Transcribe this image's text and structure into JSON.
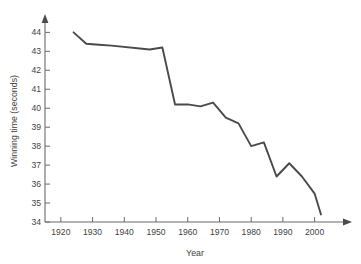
{
  "chart_data": {
    "type": "line",
    "title": "",
    "xlabel": "Year",
    "ylabel": "Winning time (seconds)",
    "xlim": [
      1915,
      2008
    ],
    "ylim": [
      34,
      44.6
    ],
    "grid": false,
    "legend": "none",
    "xticks": [
      1920,
      1930,
      1940,
      1950,
      1960,
      1970,
      1980,
      1990,
      2000
    ],
    "xtick_labels": [
      "1920",
      "1930",
      "1940",
      "1950",
      "1960",
      "1970",
      "1980",
      "1990",
      "2000"
    ],
    "yticks": [
      34,
      35,
      36,
      37,
      38,
      39,
      40,
      41,
      42,
      43,
      44
    ],
    "ytick_labels": [
      "34",
      "35",
      "36",
      "37",
      "38",
      "39",
      "40",
      "41",
      "42",
      "43",
      "44"
    ],
    "series": [
      {
        "name": "Winning time",
        "color": "#4b4a4a",
        "x": [
          1924,
          1928,
          1932,
          1936,
          1948,
          1952,
          1956,
          1960,
          1964,
          1968,
          1972,
          1976,
          1980,
          1984,
          1988,
          1992,
          1996,
          2000,
          2002
        ],
        "values": [
          44.0,
          43.4,
          43.35,
          43.3,
          43.1,
          43.2,
          40.2,
          40.2,
          40.1,
          40.3,
          39.5,
          39.2,
          38.0,
          38.2,
          36.4,
          37.1,
          36.4,
          35.5,
          34.4
        ]
      }
    ]
  },
  "axes": {
    "y_title": "Winning time (seconds)",
    "x_title": "Year"
  },
  "colors": {
    "line": "#4b4a4a",
    "axis": "#6b6b6b",
    "text": "#3f3f3f",
    "background": "#ffffff"
  }
}
